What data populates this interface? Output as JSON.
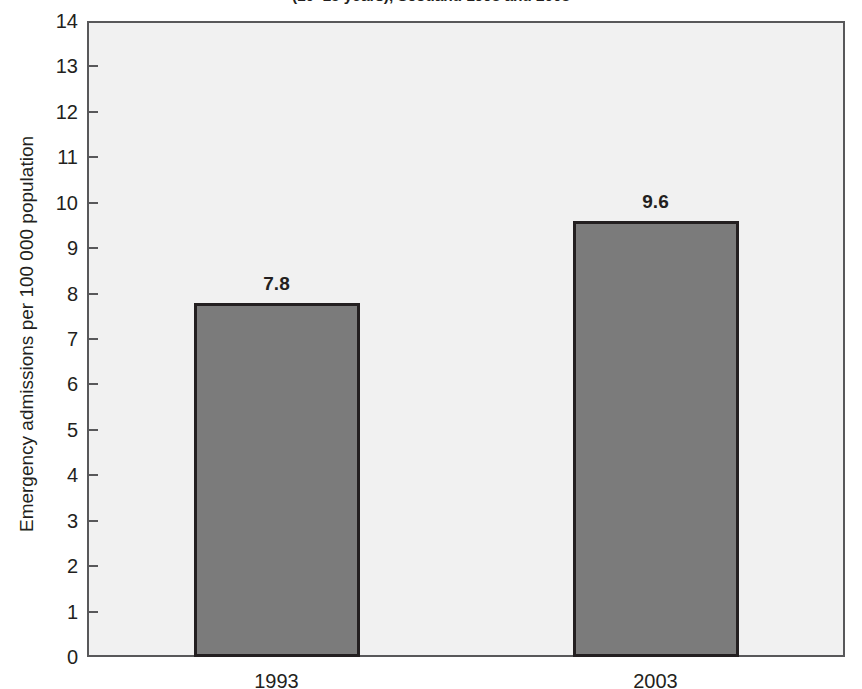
{
  "chart_data": {
    "type": "bar",
    "title": "(10–15 years), Scotland 1993 and 2003",
    "subtitle": "",
    "xlabel": "",
    "ylabel": "Emergency admissions per 100 000 population",
    "categories": [
      "1993",
      "2003"
    ],
    "values": [
      7.8,
      9.6
    ],
    "value_labels": [
      "7.8",
      "9.6"
    ],
    "ylim": [
      0,
      14
    ],
    "ytick_step": 1,
    "yticks": [
      "14",
      "13",
      "12",
      "11",
      "10",
      "9",
      "8",
      "7",
      "6",
      "5",
      "4",
      "3",
      "2",
      "1",
      "0"
    ],
    "grid": false,
    "legend": "none",
    "bar_color": "#7b7b7b",
    "bar_edge_color": "#231f20",
    "plot_background": "#f1f1f1",
    "frame_color": "#58585a",
    "text_color": "#231f20"
  },
  "figure": {
    "title": "(10–15 years), Scotland 1993 and 2003",
    "y_axis_title": "Emergency admissions per 100 000 population"
  }
}
